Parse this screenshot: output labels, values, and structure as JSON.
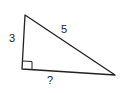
{
  "diagram": {
    "type": "right-triangle",
    "vertices": {
      "top": [
        25,
        15
      ],
      "right_angle": [
        22,
        70
      ],
      "right": [
        115,
        75
      ]
    },
    "labels": {
      "left_leg": "3",
      "hypotenuse": "5",
      "bottom_leg": "?"
    },
    "right_angle_marker": true,
    "stroke_color": "#222222"
  }
}
